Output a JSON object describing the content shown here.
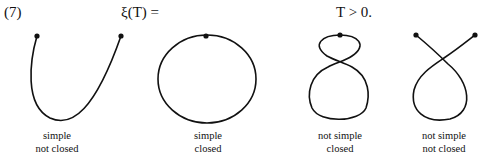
{
  "header": {
    "equation_number": "(7)",
    "lhs": "ξ(T) =",
    "condition": "T > 0."
  },
  "curves": [
    {
      "id": "open-simple",
      "line1": "simple",
      "line2": "not closed"
    },
    {
      "id": "closed-simple",
      "line1": "simple",
      "line2": "closed"
    },
    {
      "id": "closed-not-simple",
      "line1": "not simple",
      "line2": "closed"
    },
    {
      "id": "open-not-simple",
      "line1": "not simple",
      "line2": "not closed"
    }
  ],
  "colors": {
    "stroke": "#111111",
    "background": "#ffffff"
  }
}
